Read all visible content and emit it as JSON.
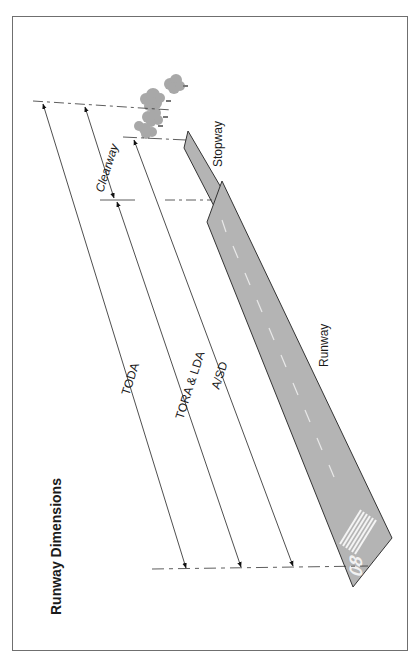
{
  "title": "Runway Dimensions",
  "labels": {
    "toda": "TODA",
    "tora_lda": "TORA & LDA",
    "asd": "A/SD",
    "clearway": "Clearway",
    "stopway": "Stopway",
    "runway": "Runway",
    "runway_number": "08"
  },
  "colors": {
    "pavement": "#b4b4b4",
    "outline": "#333333",
    "trees": "#a8a8a8",
    "line": "#333333",
    "frame": "#6f6f6f"
  }
}
